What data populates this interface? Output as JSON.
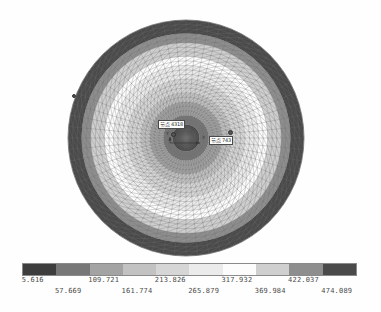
{
  "figure": {
    "kind": "fea-contour-plot",
    "background_color": "#ffffff"
  },
  "annotations": {
    "node_max": {
      "label": "节点 4318",
      "name": "node-callout-max"
    },
    "node_min": {
      "label": "节点 743",
      "name": "node-callout-min"
    },
    "axis_triad": {
      "x_label": "X",
      "y_label": "Y"
    }
  },
  "colorbar": {
    "orientation": "horizontal",
    "name": "contour-colorbar",
    "band_colors": [
      "#3d3d3d",
      "#777777",
      "#a3a3a3",
      "#c2c2c2",
      "#d6d6d6",
      "#ebebeb",
      "#fcfcfc",
      "#cfcfcf",
      "#8e8e8e",
      "#4a4a4a"
    ],
    "ticks_upper": [
      "5.616",
      "109.721",
      "213.826",
      "317.932",
      "422.037"
    ],
    "ticks_lower": [
      "57.669",
      "161.774",
      "265.879",
      "369.984",
      "474.089"
    ]
  },
  "chart_data": {
    "type": "heatmap",
    "title": "",
    "xlabel": "",
    "ylabel": "",
    "legend_position": "bottom",
    "grid": false,
    "colorbar_label": "",
    "value_range": [
      5.616,
      474.089
    ],
    "contour_levels": [
      5.616,
      57.669,
      109.721,
      161.774,
      213.826,
      265.879,
      317.932,
      369.984,
      422.037,
      474.089
    ],
    "tick_labels": [
      "5.616",
      "57.669",
      "109.721",
      "161.774",
      "213.826",
      "265.879",
      "317.932",
      "369.984",
      "422.037",
      "474.089"
    ],
    "annotations": [
      "节点 4318",
      "节点 743"
    ],
    "mesh": {
      "shape": "circular-disc",
      "element_type": "triangular",
      "radial_divisions": 26,
      "angular_divisions": 64,
      "center_px": [
        186,
        138
      ],
      "radius_px": 118
    },
    "field": {
      "pattern": "concentric-radial",
      "center_value": 474.089,
      "edge_value": 5.616
    }
  }
}
